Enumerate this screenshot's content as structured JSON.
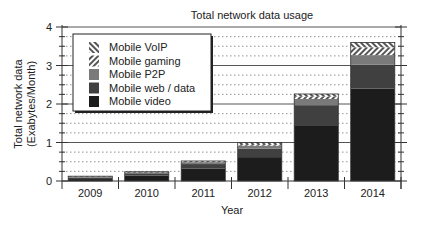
{
  "chart_data": {
    "type": "bar",
    "stacked": true,
    "title": "Total network data usage",
    "xlabel": "Year",
    "ylabel": "Total network data\n(Exabytes/Month)",
    "ylabel_lines": [
      "Total network data",
      "(Exabytes/Month)"
    ],
    "categories": [
      "2009",
      "2010",
      "2011",
      "2012",
      "2013",
      "2014"
    ],
    "ylim": [
      0,
      4
    ],
    "yticks": [
      0,
      1,
      2,
      3,
      4
    ],
    "minor_grid_step": 0.25,
    "grid": true,
    "legend_position": "upper left",
    "series": [
      {
        "name": "Mobile video",
        "color": "#1c1c1c",
        "pattern": "solid",
        "values": [
          0.05,
          0.14,
          0.32,
          0.62,
          1.45,
          2.4
        ]
      },
      {
        "name": "Mobile web/data",
        "color": "#404040",
        "pattern": "solid",
        "values": [
          0.04,
          0.06,
          0.12,
          0.22,
          0.52,
          0.62
        ]
      },
      {
        "name": "Mobile P2P",
        "color": "#7a7a7a",
        "pattern": "solid",
        "values": [
          0.025,
          0.03,
          0.05,
          0.08,
          0.16,
          0.25
        ]
      },
      {
        "name": "Mobile gaming",
        "color": "#dcdcdc",
        "pattern": "hatch-forward",
        "values": [
          0.005,
          0.01,
          0.02,
          0.04,
          0.07,
          0.2
        ]
      },
      {
        "name": "Mobile VoIP",
        "color": "#dcdcdc",
        "pattern": "hatch-back",
        "values": [
          0.005,
          0.0,
          0.01,
          0.04,
          0.06,
          0.13
        ]
      }
    ],
    "legend_order": [
      "Mobile VoIP",
      "Mobile gaming",
      "Mobile P2P",
      "Mobile web/data",
      "Mobile video"
    ]
  },
  "labels": {
    "title": "Total network data usage",
    "xlabel": "Year",
    "ylabel_line1": "Total network data",
    "ylabel_line2": "(Exabytes/Month)"
  }
}
